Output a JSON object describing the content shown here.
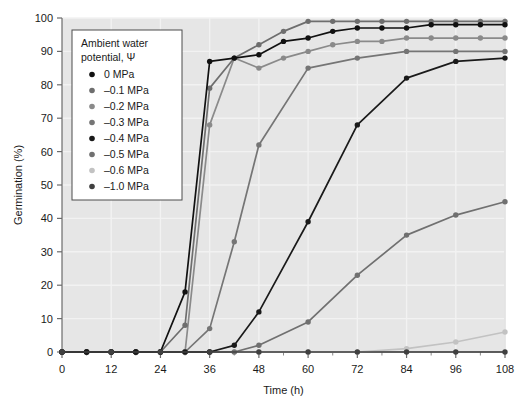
{
  "chart_data": {
    "type": "line",
    "title": "",
    "xlabel": "Time (h)",
    "ylabel": "Germination (%)",
    "xlim": [
      0,
      108
    ],
    "ylim": [
      0,
      100
    ],
    "xticks": [
      0,
      12,
      24,
      36,
      48,
      60,
      72,
      84,
      96,
      108
    ],
    "xticklabels": [
      "0",
      "12",
      "24",
      "36",
      "48",
      "60",
      "72",
      "84",
      "96",
      "108"
    ],
    "xminorticks": [
      6,
      18,
      30,
      42,
      54,
      66,
      78,
      90,
      102
    ],
    "yticks": [
      0,
      10,
      20,
      30,
      40,
      50,
      60,
      70,
      80,
      90,
      100
    ],
    "yticklabels": [
      "0",
      "10",
      "20",
      "30",
      "40",
      "50",
      "60",
      "70",
      "80",
      "90",
      "100"
    ],
    "grid": true,
    "grid_color": "#f2f2f2",
    "plot_background": "#e6e6e6",
    "legend_position": "upper-left",
    "legend_title_line1": "Ambient water",
    "legend_title_line2": "potential, Ψ",
    "series": [
      {
        "name": "0 MPa",
        "color": "#111111",
        "x": [
          0,
          6,
          12,
          18,
          24,
          30,
          36,
          42,
          48,
          54,
          60,
          66,
          72,
          78,
          84,
          90,
          96,
          102,
          108
        ],
        "values": [
          0,
          0,
          0,
          0,
          0,
          18,
          87,
          88,
          89,
          93,
          94,
          96,
          97,
          97,
          97,
          98,
          98,
          98,
          98
        ]
      },
      {
        "name": "–0.1 MPa",
        "color": "#6e6e6e",
        "x": [
          0,
          6,
          12,
          18,
          24,
          30,
          36,
          42,
          48,
          54,
          60,
          66,
          72,
          78,
          84,
          90,
          96,
          102,
          108
        ],
        "values": [
          0,
          0,
          0,
          0,
          0,
          8,
          79,
          88,
          92,
          96,
          99,
          99,
          99,
          99,
          99,
          99,
          99,
          99,
          99
        ]
      },
      {
        "name": "–0.2 MPa",
        "color": "#8a8a8a",
        "x": [
          0,
          6,
          12,
          18,
          24,
          30,
          36,
          42,
          48,
          54,
          60,
          66,
          72,
          78,
          84,
          90,
          96,
          102,
          108
        ],
        "values": [
          0,
          0,
          0,
          0,
          0,
          0,
          68,
          88,
          85,
          88,
          90,
          92,
          93,
          93,
          94,
          94,
          94,
          94,
          94
        ]
      },
      {
        "name": "–0.3 MPa",
        "color": "#757575",
        "x": [
          0,
          6,
          12,
          18,
          24,
          30,
          36,
          42,
          48,
          60,
          72,
          84,
          96,
          108
        ],
        "values": [
          0,
          0,
          0,
          0,
          0,
          0,
          7,
          33,
          62,
          85,
          88,
          90,
          90,
          90
        ]
      },
      {
        "name": "–0.4 MPa",
        "color": "#1a1a1a",
        "x": [
          0,
          6,
          12,
          18,
          24,
          30,
          36,
          42,
          48,
          60,
          72,
          84,
          96,
          108
        ],
        "values": [
          0,
          0,
          0,
          0,
          0,
          0,
          0,
          2,
          12,
          39,
          68,
          82,
          87,
          88
        ]
      },
      {
        "name": "–0.5 MPa",
        "color": "#707070",
        "x": [
          0,
          6,
          12,
          18,
          24,
          30,
          36,
          42,
          48,
          60,
          72,
          84,
          96,
          108
        ],
        "values": [
          0,
          0,
          0,
          0,
          0,
          0,
          0,
          0,
          2,
          9,
          23,
          35,
          41,
          45
        ]
      },
      {
        "name": "–0.6 MPa",
        "color": "#c2c2c2",
        "x": [
          0,
          6,
          12,
          18,
          24,
          30,
          36,
          42,
          48,
          60,
          72,
          84,
          96,
          108
        ],
        "values": [
          0,
          0,
          0,
          0,
          0,
          0,
          0,
          0,
          0,
          0,
          0,
          1,
          3,
          6
        ]
      },
      {
        "name": "–1.0 MPa",
        "color": "#404040",
        "x": [
          0,
          12,
          24,
          36,
          48,
          60,
          72,
          84,
          96,
          108
        ],
        "values": [
          0,
          0,
          0,
          0,
          0,
          0,
          0,
          0,
          0,
          0
        ]
      }
    ]
  }
}
